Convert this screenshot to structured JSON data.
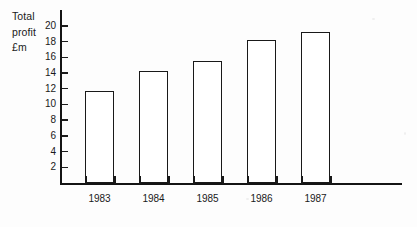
{
  "chart_data": {
    "type": "bar",
    "title": "",
    "subtitle": "",
    "xlabel": "",
    "ylabel": "Total profit £m",
    "ylabel_lines": [
      "Total",
      "profit",
      "£m"
    ],
    "categories": [
      "1983",
      "1984",
      "1985",
      "1986",
      "1987"
    ],
    "values": [
      11.7,
      14.3,
      15.5,
      18.2,
      19.2
    ],
    "ylim": [
      0,
      21
    ],
    "ytick_values": [
      2,
      4,
      6,
      8,
      10,
      12,
      14,
      16,
      18,
      20
    ],
    "ytick_labels": [
      "2",
      "4",
      "6",
      "8",
      "10",
      "12",
      "14",
      "16",
      "18",
      "20"
    ],
    "grid": false,
    "legend": null,
    "legend_position": "none",
    "bar_fill": "#ffffff",
    "bar_edge": "#191919",
    "axis_color": "#141414",
    "background": "#fdfdfd"
  }
}
